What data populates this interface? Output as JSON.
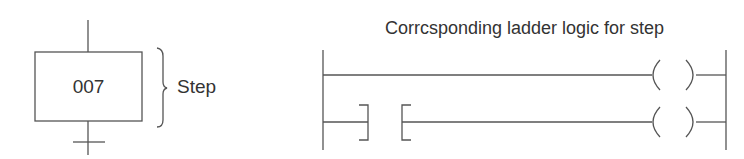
{
  "sfc": {
    "step_number": "007",
    "step_label": "Step"
  },
  "ladder": {
    "title": "Corrcsponding ladder logic for step",
    "rungs": [
      {
        "elements": [
          "wire",
          "output-coil"
        ]
      },
      {
        "elements": [
          "normally-open-contact",
          "wire",
          "output-coil"
        ]
      }
    ]
  },
  "colors": {
    "line": "#555555",
    "text": "#333333",
    "background": "#ffffff"
  }
}
